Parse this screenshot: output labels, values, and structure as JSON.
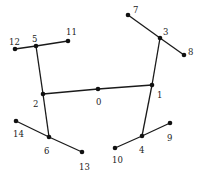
{
  "diagram": {
    "type": "tree",
    "colors": {
      "edge": "#1a1a1a",
      "node": "#111111",
      "label": "#222222",
      "background": "#ffffff"
    },
    "nodes": [
      {
        "id": "0",
        "x": 98,
        "y": 89,
        "lx": 96,
        "ly": 105
      },
      {
        "id": "1",
        "x": 152,
        "y": 85,
        "lx": 157,
        "ly": 98
      },
      {
        "id": "2",
        "x": 43,
        "y": 94,
        "lx": 33,
        "ly": 107
      },
      {
        "id": "3",
        "x": 160,
        "y": 38,
        "lx": 163,
        "ly": 35
      },
      {
        "id": "4",
        "x": 142,
        "y": 136,
        "lx": 139,
        "ly": 153
      },
      {
        "id": "5",
        "x": 36,
        "y": 46,
        "lx": 32,
        "ly": 42
      },
      {
        "id": "6",
        "x": 49,
        "y": 137,
        "lx": 44,
        "ly": 154
      },
      {
        "id": "7",
        "x": 128,
        "y": 15,
        "lx": 133,
        "ly": 13
      },
      {
        "id": "8",
        "x": 184,
        "y": 55,
        "lx": 188,
        "ly": 55
      },
      {
        "id": "9",
        "x": 170,
        "y": 123,
        "lx": 167,
        "ly": 141
      },
      {
        "id": "10",
        "x": 115,
        "y": 148,
        "lx": 112,
        "ly": 163
      },
      {
        "id": "11",
        "x": 68,
        "y": 41,
        "lx": 66,
        "ly": 35
      },
      {
        "id": "12",
        "x": 15,
        "y": 49,
        "lx": 9,
        "ly": 45
      },
      {
        "id": "13",
        "x": 82,
        "y": 152,
        "lx": 79,
        "ly": 170
      },
      {
        "id": "14",
        "x": 16,
        "y": 121,
        "lx": 13,
        "ly": 137
      }
    ],
    "edges": [
      [
        "0",
        "1"
      ],
      [
        "0",
        "2"
      ],
      [
        "1",
        "3"
      ],
      [
        "1",
        "4"
      ],
      [
        "2",
        "5"
      ],
      [
        "2",
        "6"
      ],
      [
        "3",
        "7"
      ],
      [
        "3",
        "8"
      ],
      [
        "4",
        "9"
      ],
      [
        "4",
        "10"
      ],
      [
        "5",
        "11"
      ],
      [
        "5",
        "12"
      ],
      [
        "6",
        "13"
      ],
      [
        "6",
        "14"
      ]
    ]
  }
}
